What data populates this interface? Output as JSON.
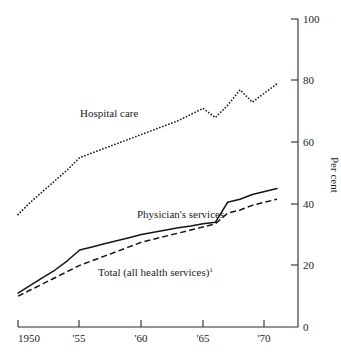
{
  "chart_data": {
    "type": "line",
    "title": "",
    "subtitle": "",
    "xlabel": "",
    "ylabel": "Per cent",
    "ylabel_position": "right",
    "grid": false,
    "legend": "inline-labels",
    "xlim": [
      1950,
      1971
    ],
    "ylim": [
      0,
      100
    ],
    "y_ticks": [
      0,
      20,
      40,
      60,
      80,
      100
    ],
    "y_tick_labels": [
      "0",
      "20",
      "40",
      "60",
      "80",
      "100"
    ],
    "x_ticks": [
      1950,
      1955,
      1960,
      1965,
      1970
    ],
    "x_tick_labels": [
      "1950",
      "'55",
      "'60",
      "'65",
      "'70"
    ],
    "x": [
      1950,
      1951,
      1952,
      1953,
      1954,
      1955,
      1956,
      1957,
      1958,
      1959,
      1960,
      1961,
      1962,
      1963,
      1964,
      1965,
      1966,
      1967,
      1968,
      1969,
      1970,
      1971
    ],
    "series": [
      {
        "name": "Hospital care",
        "style": "dotted",
        "label": "Hospital care",
        "values": [
          36.5,
          40.5,
          44.0,
          47.5,
          51.0,
          55.0,
          56.5,
          58.0,
          59.5,
          61.0,
          62.5,
          64.0,
          65.5,
          67.0,
          69.0,
          71.0,
          68.0,
          72.0,
          77.0,
          73.0,
          76.0,
          79.0
        ]
      },
      {
        "name": "Physician's services",
        "style": "solid",
        "label": "Physician's services",
        "values": [
          11.0,
          13.5,
          16.0,
          18.5,
          21.5,
          25.0,
          26.0,
          27.0,
          28.0,
          29.0,
          30.0,
          30.8,
          31.5,
          32.2,
          32.8,
          33.5,
          34.0,
          40.5,
          41.5,
          43.0,
          44.0,
          45.0
        ]
      },
      {
        "name": "Total (all health services)",
        "style": "dashed",
        "label": "Total (all health services)",
        "label_footnote": "1",
        "values": [
          10.0,
          12.0,
          14.0,
          16.0,
          18.0,
          20.0,
          21.5,
          23.0,
          24.5,
          26.0,
          27.5,
          28.5,
          29.5,
          30.5,
          31.5,
          32.5,
          33.5,
          37.0,
          38.0,
          39.5,
          40.5,
          41.5
        ]
      }
    ],
    "annotations": [
      {
        "text": "Hospital care",
        "x": 1955.5,
        "y": 113,
        "anchor": "series-label-hospital-care"
      },
      {
        "text": "Physician's services",
        "x": 1960.0,
        "y": 214,
        "anchor": "series-label-physicians-services"
      },
      {
        "text": "Total (all health services)",
        "footnote": "1",
        "x": 1957.0,
        "y": 272,
        "anchor": "series-label-total"
      }
    ]
  }
}
